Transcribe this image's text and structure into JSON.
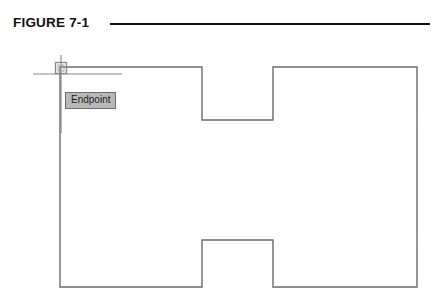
{
  "figure": {
    "label": "FIGURE 7-1",
    "rule_color": "#111111"
  },
  "drawing": {
    "line_color": "#6b6b6b",
    "line_width": 1.4,
    "background": "#ffffff",
    "shape_name": "i-beam-outline",
    "outline_points": [
      [
        60,
        67
      ],
      [
        202,
        67
      ],
      [
        202,
        120
      ],
      [
        273,
        120
      ],
      [
        273,
        67
      ],
      [
        417,
        67
      ],
      [
        417,
        287
      ],
      [
        273,
        287
      ],
      [
        273,
        240
      ],
      [
        202,
        240
      ],
      [
        202,
        287
      ],
      [
        60,
        287
      ]
    ]
  },
  "cursor": {
    "name": "crosshair-cursor",
    "color": "#8a8a8a",
    "center_x": 61,
    "center_y": 68,
    "vertical_line": {
      "x": 61,
      "y1": 55,
      "y2": 133
    },
    "horizontal_line": {
      "y": 74,
      "x1": 33,
      "x2": 122
    },
    "snap_marker": {
      "name": "endpoint-snap-marker",
      "shape": "square",
      "size": 11,
      "color": "#8a8a8a"
    }
  },
  "tooltip": {
    "label": "Endpoint",
    "background": "#b9b9b9",
    "border_color": "#6e6e6e",
    "text_color": "#1d1d1d"
  }
}
